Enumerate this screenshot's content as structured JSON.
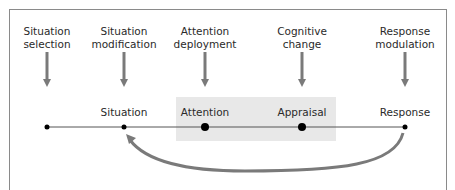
{
  "strategies": [
    {
      "line1": "Situation",
      "line2": "selection",
      "x": 47
    },
    {
      "line1": "Situation",
      "line2": "modification",
      "x": 124
    },
    {
      "line1": "Attention",
      "line2": "deployment",
      "x": 205
    },
    {
      "line1": "Cognitive",
      "line2": "change",
      "x": 302
    },
    {
      "line1": "Response",
      "line2": "modulation",
      "x": 405
    }
  ],
  "stages": [
    {
      "label": "",
      "x": 47
    },
    {
      "label": "Situation",
      "x": 124
    },
    {
      "label": "Attention",
      "x": 205
    },
    {
      "label": "Appraisal",
      "x": 302
    },
    {
      "label": "Response",
      "x": 405
    }
  ],
  "colors": {
    "arrow": "#7a7a7a",
    "line": "#555555",
    "shade": "#e8e8e8",
    "dot": "#000000"
  }
}
